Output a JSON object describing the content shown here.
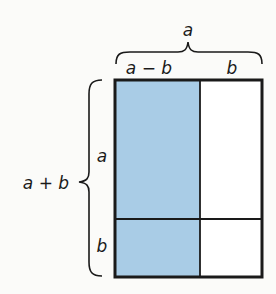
{
  "diagram": {
    "top_brace_label": "a",
    "top_sublabels": {
      "left": "a − b",
      "right": "b"
    },
    "left_brace_label": "a + b",
    "left_sublabels": {
      "top": "a",
      "bottom": "b"
    },
    "colors": {
      "shaded_fill": "#a9cce6",
      "unshaded_fill": "#ffffff",
      "outline": "#1a1a1a"
    },
    "regions": [
      {
        "name": "top-left",
        "shaded": true
      },
      {
        "name": "top-right",
        "shaded": false
      },
      {
        "name": "bottom-left",
        "shaded": true
      },
      {
        "name": "bottom-right",
        "shaded": false
      }
    ]
  }
}
